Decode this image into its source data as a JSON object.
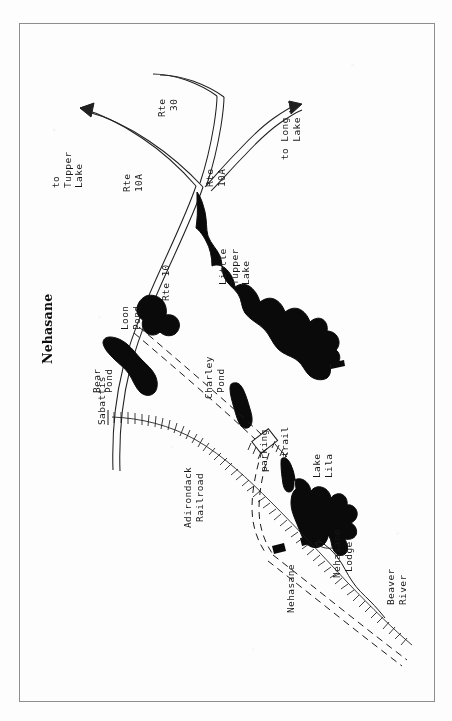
{
  "document": {
    "title": "Nehasane",
    "type": "scanned-topographic-locator-map",
    "orientation_note": "All map labels are rotated 90 degrees counter-clockwise (read bottom-to-top)",
    "frame": {
      "stroke": "#8e8e8e",
      "x": 19,
      "y": 23,
      "width": 414,
      "height": 677
    }
  },
  "colors": {
    "ink": "#171717",
    "water_fill": "#0a0a0a",
    "paper": "#fdfdfd",
    "frame_line": "#8e8e8e"
  },
  "labels": {
    "title": "Nehasane",
    "destinations": [
      {
        "id": "to-tupper-lake",
        "text": "to\nTupper\nLake"
      },
      {
        "id": "to-long-lake",
        "text": "to Long\n   Lake"
      }
    ],
    "routes": [
      {
        "id": "rte-30",
        "text": "Rte\n 30"
      },
      {
        "id": "rte-10a-north",
        "text": "Rte\n10A"
      },
      {
        "id": "rte-10a-east",
        "text": "Rte\n10A"
      },
      {
        "id": "rte-10",
        "text": "Rte 10"
      }
    ],
    "water_bodies": [
      {
        "id": "bear-pond",
        "text": "Bear\nPond"
      },
      {
        "id": "loon-pond",
        "text": "Loon\nPond"
      },
      {
        "id": "little-tupper-lake",
        "text": "Little\nTupper\nLake"
      },
      {
        "id": "charley-pond",
        "text": "Charley\n Pond"
      },
      {
        "id": "lake-lila",
        "text": "Lake\nLila"
      },
      {
        "id": "beaver-river",
        "text": "Beaver\nRiver"
      }
    ],
    "places": [
      {
        "id": "sabattis",
        "text": "Sabattis"
      },
      {
        "id": "nehasane-station",
        "text": "Nehasane"
      },
      {
        "id": "nehasane-lodge",
        "text": "Nehasane\n Lodge"
      },
      {
        "id": "parking",
        "text": "parking"
      },
      {
        "id": "trail",
        "text": "trail"
      }
    ],
    "infrastructure": [
      {
        "id": "adirondack-railroad",
        "text": "Adirondack\n Railroad"
      }
    ]
  },
  "legend_implied": {
    "double_line": "paved highway (Rte 10, Rte 10A, Rte 30)",
    "dashed_double_line": "unpaved road",
    "cross_tick_line": "railroad",
    "hatched_short_line": "foot trail",
    "solid_thin_line": "river",
    "black_fill": "lake or pond",
    "small_black_rectangle": "building / station"
  }
}
